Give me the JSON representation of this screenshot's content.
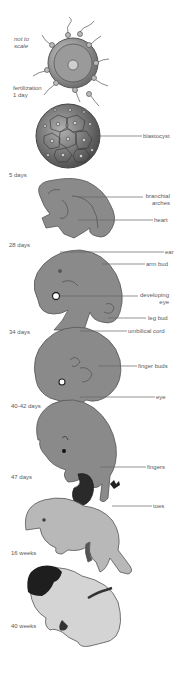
{
  "diagram": {
    "note": {
      "line1": "not to",
      "line2": "scale"
    },
    "stages": [
      {
        "id": "fertilization",
        "label_line1": "fertilization",
        "label_line2": "1 day"
      },
      {
        "id": "5-days",
        "label": "5 days"
      },
      {
        "id": "28-days",
        "label": "28 days"
      },
      {
        "id": "34-days",
        "label": "34 days"
      },
      {
        "id": "40-42-days",
        "label": "40-42 days"
      },
      {
        "id": "47-days",
        "label": "47 days"
      },
      {
        "id": "16-weeks",
        "label": "16 weeks"
      },
      {
        "id": "40-weeks",
        "label": "40 weeks"
      }
    ],
    "callouts": {
      "blastocyst": "blastocyst",
      "branchial_line1": "branchial",
      "branchial_line2": "arches",
      "heart": "heart",
      "ear": "ear",
      "arm_bud": "arm bud",
      "developing_eye_line1": "developing",
      "developing_eye_line2": "eye",
      "leg_bud": "leg bud",
      "umbilical_cord": "umbilical cord",
      "finger_buds": "finger buds",
      "eye": "eye",
      "fingers": "fingers",
      "toes": "toes"
    },
    "colors": {
      "embryo_fill": "#8a8a8a",
      "embryo_outline": "#555555",
      "fetus_light": "#c8c8c8",
      "hair": "#1e1e1e",
      "label_text": "#5a5a5a"
    }
  }
}
